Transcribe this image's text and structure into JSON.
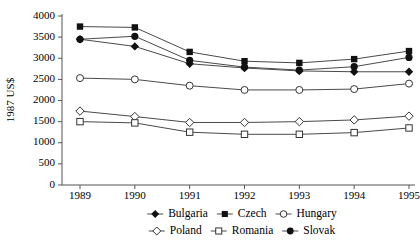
{
  "chart_data": {
    "type": "line",
    "title": "",
    "xlabel": "",
    "ylabel": "1987 US$",
    "categories": [
      "1989",
      "1990",
      "1991",
      "1992",
      "1993",
      "1994",
      "1995"
    ],
    "x": [
      1989,
      1990,
      1991,
      1992,
      1993,
      1994,
      1995
    ],
    "ylim": [
      0,
      4000
    ],
    "yticks": [
      0,
      500,
      1000,
      1500,
      2000,
      2500,
      3000,
      3500,
      4000
    ],
    "ytick_labels": [
      "0",
      "500",
      "1000",
      "1500",
      "2000",
      "2500",
      "3000",
      "3500",
      "4000"
    ],
    "grid": false,
    "legend_position": "bottom",
    "series": [
      {
        "name": "Bulgaria",
        "marker": "filled-diamond",
        "values": [
          3450,
          3280,
          2870,
          2770,
          2700,
          2680,
          2680
        ]
      },
      {
        "name": "Czech",
        "marker": "filled-square",
        "values": [
          3750,
          3730,
          3150,
          2930,
          2890,
          2980,
          3170
        ]
      },
      {
        "name": "Hungary",
        "marker": "open-circle",
        "values": [
          2530,
          2500,
          2350,
          2250,
          2250,
          2270,
          2400
        ]
      },
      {
        "name": "Poland",
        "marker": "open-diamond",
        "values": [
          1750,
          1620,
          1480,
          1480,
          1500,
          1540,
          1630
        ]
      },
      {
        "name": "Romania",
        "marker": "open-square",
        "values": [
          1500,
          1470,
          1250,
          1200,
          1200,
          1240,
          1350
        ]
      },
      {
        "name": "Slovak",
        "marker": "filled-circle",
        "values": [
          3450,
          3520,
          2950,
          2790,
          2720,
          2800,
          3020
        ]
      }
    ]
  },
  "colors": {
    "line": "#4a4a4a",
    "marker_fill": "#111111",
    "marker_open": "#ffffff",
    "axis": "#555555",
    "text": "#000000"
  }
}
